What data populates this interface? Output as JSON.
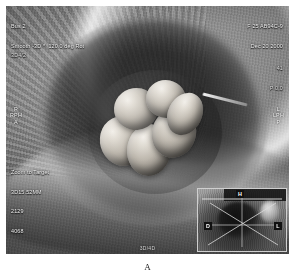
{
  "figure": {
    "caption": "A",
    "modality": "3D surface-rendered obstetric ultrasound"
  },
  "header": {
    "left_line1": "Bus 2",
    "left_line2": "Smooth -3D *  120.0 deg Rot",
    "right_line1": "F 25 AB94C-9",
    "right_line2": "Dec 20 2000"
  },
  "gain": {
    "left": "3D4/2",
    "right_line1": "41",
    "right_line2": "P 0.0"
  },
  "orientation": {
    "left": "R\nRPH\nA",
    "right": "L\nLPH\nP"
  },
  "settings": {
    "line1": "Zoom to Target",
    "line2": "3D15.52MM",
    "line3": "2129",
    "line4": "4068"
  },
  "bottom_center": {
    "label": "3D/4D"
  },
  "inset": {
    "title": "orientation-reference-planes",
    "markers": [
      {
        "id": "marker-h",
        "label": "H"
      },
      {
        "id": "marker-d",
        "label": "D"
      },
      {
        "id": "marker-l",
        "label": "L"
      }
    ]
  },
  "colors": {
    "overlay_text": "#f2f2f2",
    "inset_border": "#cfcfcf",
    "caption_text": "#1b1b1b",
    "background": "#ffffff"
  }
}
